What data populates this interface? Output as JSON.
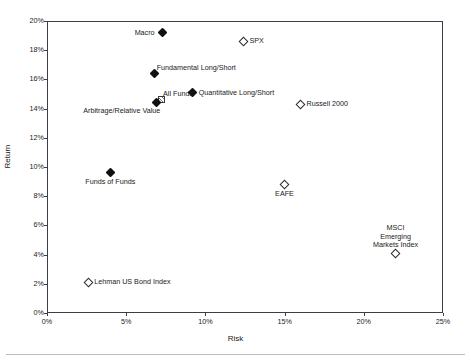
{
  "chart_data": {
    "type": "scatter",
    "title": "",
    "xlabel": "Risk",
    "ylabel": "Return",
    "xlim": [
      0,
      25
    ],
    "ylim": [
      0,
      20
    ],
    "x_tick_labels": [
      "0%",
      "5%",
      "10%",
      "15%",
      "20%",
      "25%"
    ],
    "x_tick_values": [
      0,
      5,
      10,
      15,
      20,
      25
    ],
    "y_tick_labels": [
      "0%",
      "2%",
      "4%",
      "6%",
      "8%",
      "10%",
      "12%",
      "14%",
      "16%",
      "18%",
      "20%"
    ],
    "y_tick_values": [
      0,
      2,
      4,
      6,
      8,
      10,
      12,
      14,
      16,
      18,
      20
    ],
    "grid": false,
    "legend": "none",
    "units": "percent",
    "points": [
      {
        "label": "Macro",
        "x": 7.3,
        "y": 19.2,
        "marker": "diamond-filled",
        "label_position": "left"
      },
      {
        "label": "SPX",
        "x": 12.4,
        "y": 18.6,
        "marker": "diamond-open",
        "label_position": "right"
      },
      {
        "label": "Fundamental Long/Short",
        "x": 6.8,
        "y": 16.4,
        "marker": "diamond-filled",
        "label_position": "above-right"
      },
      {
        "label": "Quantitative Long/Short",
        "x": 9.2,
        "y": 15.1,
        "marker": "diamond-filled",
        "label_position": "right"
      },
      {
        "label": "All Funds",
        "x": 7.2,
        "y": 14.6,
        "marker": "square-hatched",
        "label_position": "above-right"
      },
      {
        "label": "Russell 2000",
        "x": 16.0,
        "y": 14.3,
        "marker": "diamond-open",
        "label_position": "right"
      },
      {
        "label": "Arbitrage/Relative Value",
        "x": 6.9,
        "y": 14.4,
        "marker": "diamond-filled",
        "label_position": "below-left"
      },
      {
        "label": "Funds of Funds",
        "x": 4.0,
        "y": 9.6,
        "marker": "diamond-filled",
        "label_position": "below"
      },
      {
        "label": "EAFE",
        "x": 15.0,
        "y": 8.8,
        "marker": "diamond-open",
        "label_position": "below"
      },
      {
        "label": "MSCI Emerging Markets Index",
        "x": 22.0,
        "y": 4.1,
        "marker": "diamond-open",
        "label_position": "above",
        "label_lines": [
          "MSCI",
          "Emerging",
          "Markets Index"
        ]
      },
      {
        "label": "Lehman US Bond Index",
        "x": 2.6,
        "y": 2.1,
        "marker": "diamond-open",
        "label_position": "right"
      }
    ]
  },
  "axes": {
    "x_title": "Risk",
    "y_title": "Return"
  },
  "colors": {
    "frame": "#3c3c4a",
    "text": "#1a1a1a",
    "marker_fill": "#111111",
    "marker_open_stroke": "#2a2a2a",
    "background": "#ffffff"
  }
}
